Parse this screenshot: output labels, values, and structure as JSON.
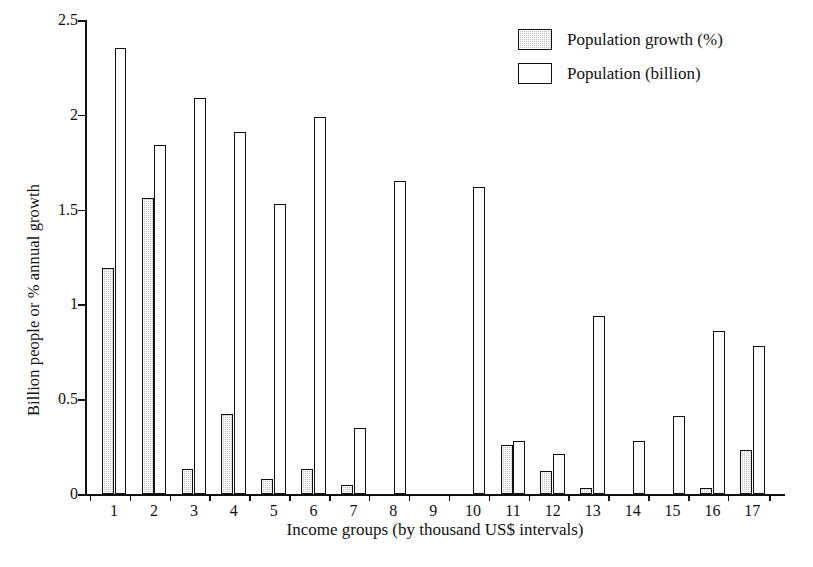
{
  "chart_data": {
    "type": "bar",
    "title": "",
    "xlabel": "Income groups (by thousand US$ intervals)",
    "ylabel": "Billion people or % annual growth",
    "categories": [
      "1",
      "2",
      "3",
      "4",
      "5",
      "6",
      "7",
      "8",
      "9",
      "10",
      "11",
      "12",
      "13",
      "14",
      "15",
      "16",
      "17"
    ],
    "ylim": [
      0,
      2.5
    ],
    "yticks": [
      0,
      0.5,
      1,
      1.5,
      2,
      2.5
    ],
    "ytick_labels": [
      "0",
      "0.5",
      "1",
      "1.5",
      "2",
      "2.5"
    ],
    "grid": false,
    "legend_position": "top-right",
    "series": [
      {
        "name": "Population growth (%)",
        "fill": "#c2c2c2",
        "values": [
          1.19,
          1.56,
          0.13,
          0.42,
          0.08,
          0.13,
          0.05,
          0.0,
          0.0,
          0.0,
          0.26,
          0.12,
          0.03,
          0.0,
          0.0,
          0.03,
          0.23
        ]
      },
      {
        "name": "Population (billion)",
        "fill": "#ffffff",
        "values": [
          2.35,
          1.84,
          2.09,
          1.91,
          1.53,
          1.99,
          0.35,
          1.65,
          0.0,
          1.62,
          0.28,
          0.21,
          0.94,
          0.28,
          0.41,
          0.86,
          0.78
        ]
      }
    ]
  },
  "legend": {
    "items": [
      {
        "label": "Population growth (%)",
        "swatch": "growth"
      },
      {
        "label": "Population (billion)",
        "swatch": "population"
      }
    ]
  },
  "axes": {
    "y_title": "Billion people or % annual growth",
    "x_title": "Income groups (by thousand US$ intervals)"
  }
}
